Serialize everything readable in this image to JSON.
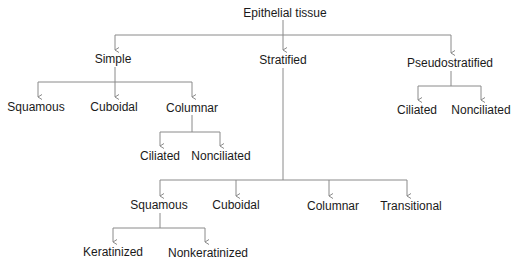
{
  "diagram": {
    "type": "tree",
    "line_color": "#8a8a8a",
    "text_color": "#1a1a1a",
    "root": {
      "label": "Epithelial tissue",
      "children": [
        {
          "label": "Simple",
          "children": [
            {
              "label": "Squamous"
            },
            {
              "label": "Cuboidal"
            },
            {
              "label": "Columnar",
              "children": [
                {
                  "label": "Ciliated"
                },
                {
                  "label": "Nonciliated"
                }
              ]
            }
          ]
        },
        {
          "label": "Stratified",
          "children": [
            {
              "label": "Squamous",
              "children": [
                {
                  "label": "Keratinized"
                },
                {
                  "label": "Nonkeratinized"
                }
              ]
            },
            {
              "label": "Cuboidal"
            },
            {
              "label": "Columnar"
            },
            {
              "label": "Transitional"
            }
          ]
        },
        {
          "label": "Pseudostratified",
          "children": [
            {
              "label": "Ciliated"
            },
            {
              "label": "Nonciliated"
            }
          ]
        }
      ]
    }
  },
  "nodes": {
    "root": "Epithelial tissue",
    "simple": "Simple",
    "stratified": "Stratified",
    "pseudostratified": "Pseudostratified",
    "simple_squamous": "Squamous",
    "simple_cuboidal": "Cuboidal",
    "simple_columnar": "Columnar",
    "simple_columnar_ciliated": "Ciliated",
    "simple_columnar_nonciliated": "Nonciliated",
    "pseudo_ciliated": "Ciliated",
    "pseudo_nonciliated": "Nonciliated",
    "strat_squamous": "Squamous",
    "strat_cuboidal": "Cuboidal",
    "strat_columnar": "Columnar",
    "strat_transitional": "Transitional",
    "strat_squamous_keratinized": "Keratinized",
    "strat_squamous_nonkeratinized": "Nonkeratinized"
  }
}
